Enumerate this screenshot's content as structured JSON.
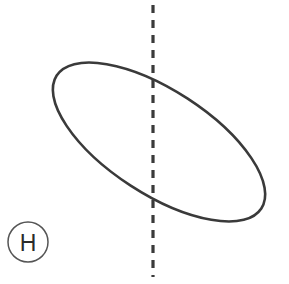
{
  "figure": {
    "canvas": {
      "width": 289,
      "height": 284,
      "background_color": "#ffffff"
    },
    "stroke_color": "#3a3a3a",
    "label_color": "#2b2b2b",
    "badge_stroke_color": "#555555",
    "shape": {
      "name": "ellipse",
      "center_x": 159,
      "center_y": 142,
      "semi_major_axis": 122,
      "semi_minor_axis": 52,
      "rotation_degrees": 33,
      "stroke_width": 2.6
    },
    "axis_line": {
      "name": "vertical-dashed-line",
      "orientation": "vertical",
      "x": 153,
      "y_start": 5,
      "y_end": 277,
      "dash_on": 8,
      "dash_off": 7,
      "stroke_width": 3.2
    },
    "badge": {
      "label": "H",
      "center_x": 28,
      "center_y": 242,
      "radius": 20,
      "stroke_width": 1.5
    }
  }
}
